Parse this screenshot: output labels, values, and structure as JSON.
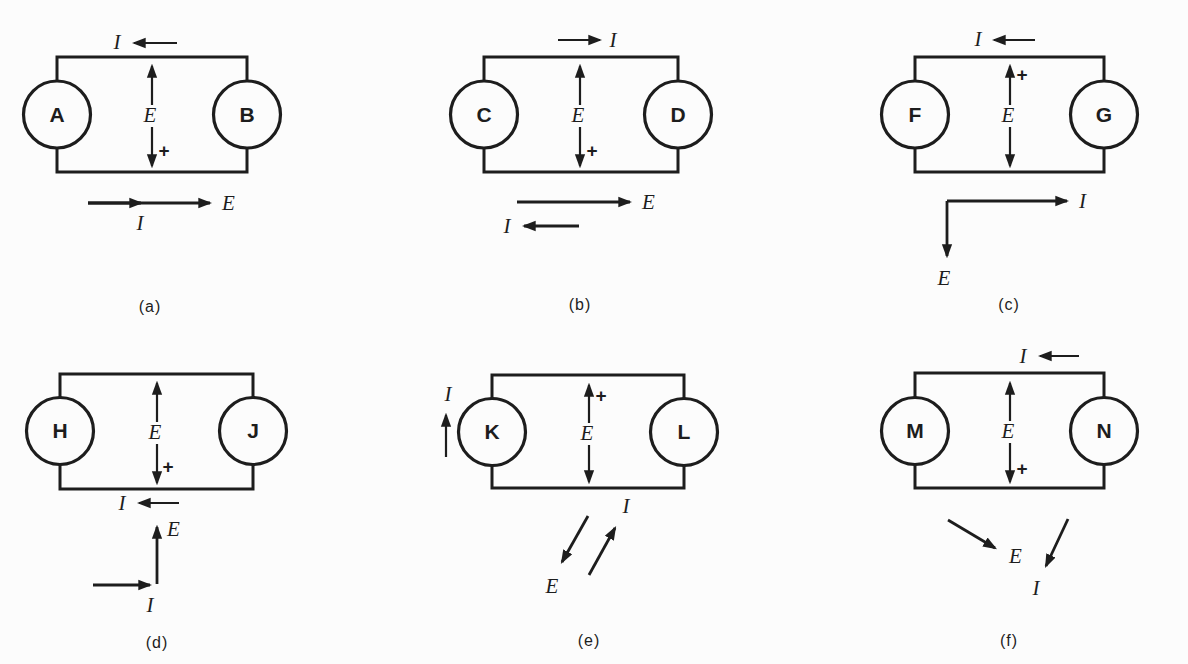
{
  "figure": {
    "background_color": "#fcfcfc",
    "line_color": "#1d1d1d",
    "circuits": [
      {
        "id": "a",
        "caption": "(a)",
        "left_device": "A",
        "right_device": "B",
        "voltage_label": "E",
        "plus_sign": "+",
        "plus_position": "bottom",
        "loop_current": {
          "label": "I",
          "position": "above-top-wire",
          "direction": "left"
        },
        "phasor_diagram": {
          "arrows": [
            {
              "label": "E",
              "direction": "right",
              "length": "long"
            },
            {
              "label": "I",
              "direction": "right",
              "length": "short"
            }
          ]
        }
      },
      {
        "id": "b",
        "caption": "(b)",
        "left_device": "C",
        "right_device": "D",
        "voltage_label": "E",
        "plus_sign": "+",
        "plus_position": "bottom",
        "loop_current": {
          "label": "I",
          "position": "above-top-wire",
          "direction": "right"
        },
        "phasor_diagram": {
          "arrows": [
            {
              "label": "E",
              "direction": "right"
            },
            {
              "label": "I",
              "direction": "left"
            }
          ]
        }
      },
      {
        "id": "c",
        "caption": "(c)",
        "left_device": "F",
        "right_device": "G",
        "voltage_label": "E",
        "plus_sign": "+",
        "plus_position": "top",
        "loop_current": {
          "label": "I",
          "position": "above-top-wire",
          "direction": "left"
        },
        "phasor_diagram": {
          "arrows": [
            {
              "label": "I",
              "direction": "right"
            },
            {
              "label": "E",
              "direction": "down"
            }
          ]
        }
      },
      {
        "id": "d",
        "caption": "(d)",
        "left_device": "H",
        "right_device": "J",
        "voltage_label": "E",
        "plus_sign": "+",
        "plus_position": "bottom",
        "loop_current": {
          "label": "I",
          "position": "below-bottom-wire",
          "direction": "left"
        },
        "phasor_diagram": {
          "arrows": [
            {
              "label": "E",
              "direction": "up"
            },
            {
              "label": "I",
              "direction": "right"
            }
          ]
        }
      },
      {
        "id": "e",
        "caption": "(e)",
        "left_device": "K",
        "right_device": "L",
        "voltage_label": "E",
        "plus_sign": "+",
        "plus_position": "top",
        "loop_current": {
          "label": "I",
          "position": "left-of-left-device",
          "direction": "up"
        },
        "phasor_diagram": {
          "arrows": [
            {
              "label": "E",
              "direction": "down-left"
            },
            {
              "label": "I",
              "direction": "up-right"
            }
          ]
        }
      },
      {
        "id": "f",
        "caption": "(f)",
        "left_device": "M",
        "right_device": "N",
        "voltage_label": "E",
        "plus_sign": "+",
        "plus_position": "bottom",
        "loop_current": {
          "label": "I",
          "position": "above-top-wire",
          "direction": "left"
        },
        "phasor_diagram": {
          "arrows": [
            {
              "label": "E",
              "direction": "down-right"
            },
            {
              "label": "I",
              "direction": "down-left-steep"
            }
          ]
        }
      }
    ]
  }
}
